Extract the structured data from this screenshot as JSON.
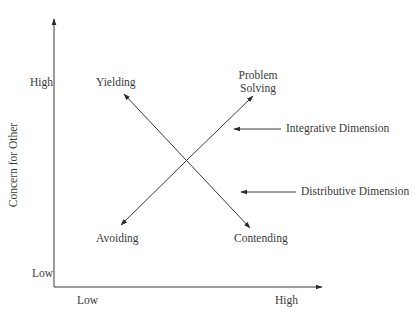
{
  "diagram": {
    "type": "dual-concern-model",
    "y_axis": {
      "label": "Concern for Other",
      "high_label": "High",
      "low_label": "Low"
    },
    "x_axis": {
      "label": "",
      "low_label": "Low",
      "high_label": "High"
    },
    "strategies": {
      "top_left": "Yielding",
      "top_right_line1": "Problem",
      "top_right_line2": "Solving",
      "bottom_left": "Avoiding",
      "bottom_right": "Contending"
    },
    "dimensions": {
      "integrative": "Integrative Dimension",
      "distributive": "Distributive Dimension"
    },
    "colors": {
      "line": "#3a3a3a",
      "text": "#3a3a3a",
      "background": "#ffffff"
    }
  }
}
